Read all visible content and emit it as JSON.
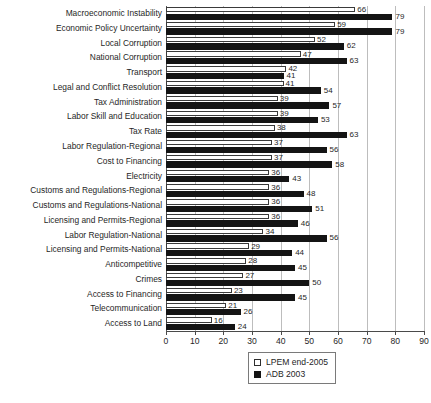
{
  "chart_data": {
    "type": "bar",
    "orientation": "horizontal",
    "title": "",
    "subtitle": "",
    "xlabel": "",
    "ylabel": "",
    "xlim": [
      0,
      90
    ],
    "xticks": [
      0,
      10,
      20,
      30,
      40,
      50,
      60,
      70,
      80,
      90
    ],
    "grid": true,
    "grid_axis": "x",
    "legend_position": "bottom-center",
    "categories": [
      "Macroeconomic Instability",
      "Economic Policy Uncertainty",
      "Local Corruption",
      "National Corruption",
      "Transport",
      "Legal and Conflict Resolution",
      "Tax Administration",
      "Labor Skill and Education",
      "Tax Rate",
      "Labor Regulation-Regional",
      "Cost to Financing",
      "Electricity",
      "Customs and Regulations-Regional",
      "Customs and Regulations-National",
      "Licensing and Permits-Regional",
      "Labor Regulation-National",
      "Licensing and Permits-National",
      "Anticompetitive",
      "Crimes",
      "Access to Financing",
      "Telecommunication",
      "Access to Land"
    ],
    "series": [
      {
        "name": "LPEM end-2005",
        "color": "#ffffff",
        "edge_color": "#3a3a3a",
        "values": [
          66,
          59,
          52,
          47,
          42,
          41,
          39,
          39,
          38,
          37,
          37,
          36,
          36,
          36,
          36,
          34,
          29,
          28,
          27,
          23,
          21,
          16
        ]
      },
      {
        "name": "ADB 2003",
        "color": "#141414",
        "edge_color": "#141414",
        "values": [
          79,
          79,
          62,
          63,
          41,
          54,
          57,
          53,
          63,
          56,
          58,
          43,
          48,
          51,
          46,
          56,
          44,
          45,
          50,
          45,
          26,
          24
        ]
      }
    ],
    "legend": [
      {
        "label": "LPEM end-2005",
        "swatch": "hollow-square"
      },
      {
        "label": "ADB 2003",
        "swatch": "filled-square"
      }
    ],
    "colors": {
      "lpem": "#ffffff",
      "adb": "#141414",
      "grid": "#bdbdbd",
      "axis": "#4a4a4a",
      "text": "#1f1f1f",
      "background": "#ffffff"
    }
  }
}
